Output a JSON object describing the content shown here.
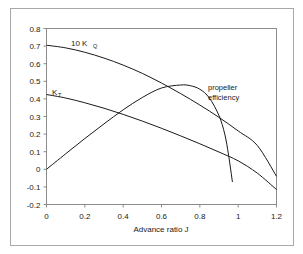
{
  "chart_data": {
    "type": "line",
    "title": "",
    "xlabel": "Advance ratio J",
    "ylabel": "",
    "xlim": [
      0,
      1.2
    ],
    "ylim": [
      -0.2,
      0.8
    ],
    "grid": false,
    "legend_position": "inline-annotations",
    "xticks": [
      "0",
      "0.2",
      "0.4",
      "0.6",
      "0.8",
      "1",
      "1.2"
    ],
    "xtick_values": [
      0,
      0.2,
      0.4,
      0.6,
      0.8,
      1,
      1.2
    ],
    "yticks": [
      "0.8",
      "0.7",
      "0.6",
      "0.5",
      "0.4",
      "0.3",
      "0.2",
      "0.1",
      "0",
      "-0.1",
      "-0.2"
    ],
    "ytick_values": [
      0.8,
      0.7,
      0.6,
      0.5,
      0.4,
      0.3,
      0.2,
      0.1,
      0,
      -0.1,
      -0.2
    ],
    "series": [
      {
        "name": "10 KQ",
        "label_main": "10 K",
        "label_sub": "Q",
        "x": [
          0,
          0.1,
          0.2,
          0.3,
          0.4,
          0.5,
          0.6,
          0.7,
          0.8,
          0.9,
          1.0,
          1.1,
          1.2
        ],
        "values": [
          0.705,
          0.69,
          0.665,
          0.632,
          0.592,
          0.545,
          0.49,
          0.43,
          0.365,
          0.295,
          0.218,
          0.135,
          -0.04
        ]
      },
      {
        "name": "KT",
        "label_main": "K",
        "label_sub": "T",
        "x": [
          0,
          0.1,
          0.2,
          0.3,
          0.4,
          0.5,
          0.6,
          0.7,
          0.8,
          0.9,
          1.0,
          1.1,
          1.2
        ],
        "values": [
          0.425,
          0.405,
          0.378,
          0.347,
          0.312,
          0.274,
          0.233,
          0.19,
          0.145,
          0.098,
          0.048,
          -0.022,
          -0.115
        ]
      },
      {
        "name": "propeller efficiency",
        "label_line1": "propeller",
        "label_line2": "efficiency",
        "x": [
          0,
          0.1,
          0.2,
          0.3,
          0.4,
          0.5,
          0.6,
          0.7,
          0.75,
          0.8,
          0.85,
          0.9,
          0.93,
          0.95,
          0.97
        ],
        "values": [
          0.0,
          0.088,
          0.175,
          0.258,
          0.338,
          0.408,
          0.462,
          0.479,
          0.475,
          0.455,
          0.405,
          0.305,
          0.2,
          0.08,
          -0.072
        ]
      }
    ]
  }
}
